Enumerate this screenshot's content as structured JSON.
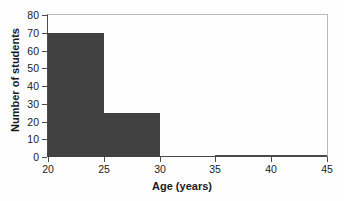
{
  "chart_data": {
    "type": "bar",
    "title": "",
    "subtitle": "",
    "xlabel": "Age (years)",
    "ylabel": "Number of students",
    "xlim": [
      20,
      45
    ],
    "ylim": [
      0,
      80
    ],
    "grid": false,
    "legend": null,
    "bar_color": "#414141",
    "axis_color": "#4a4a4a",
    "frame_color": "#b9b9b9",
    "background_color": "#fefefe",
    "xticks": [
      {
        "value": 20,
        "label": "20"
      },
      {
        "value": 25,
        "label": "25"
      },
      {
        "value": 30,
        "label": "30"
      },
      {
        "value": 35,
        "label": "35"
      },
      {
        "value": 40,
        "label": "40"
      },
      {
        "value": 45,
        "label": "45"
      }
    ],
    "yticks": [
      {
        "value": 0,
        "label": "0"
      },
      {
        "value": 10,
        "label": "10"
      },
      {
        "value": 20,
        "label": "20"
      },
      {
        "value": 30,
        "label": "30"
      },
      {
        "value": 40,
        "label": "40"
      },
      {
        "value": 50,
        "label": "50"
      },
      {
        "value": 60,
        "label": "60"
      },
      {
        "value": 70,
        "label": "70"
      },
      {
        "value": 80,
        "label": "80"
      }
    ],
    "bins": [
      {
        "x0": 20,
        "x1": 25,
        "value": 70
      },
      {
        "x0": 25,
        "x1": 30,
        "value": 25
      },
      {
        "x0": 30,
        "x1": 35,
        "value": 0
      },
      {
        "x0": 35,
        "x1": 45,
        "value": 1
      }
    ],
    "categories": [
      "20-25",
      "25-30",
      "30-35",
      "35-45"
    ],
    "values": [
      70,
      25,
      0,
      1
    ]
  }
}
